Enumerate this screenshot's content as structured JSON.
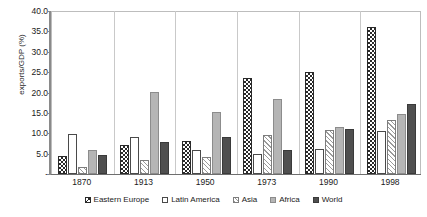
{
  "chart_data": {
    "type": "bar",
    "title": "",
    "xlabel": "",
    "ylabel": "exports/GDP (%)",
    "ylim": [
      0,
      40
    ],
    "ytick_step": 5,
    "ytick_labels": [
      "40.0",
      "35.0",
      "30.0",
      "25.0",
      "20.0",
      "15.0",
      "10.0",
      "5.0",
      "-"
    ],
    "ytick_values": [
      40,
      35,
      30,
      25,
      20,
      15,
      10,
      5,
      0
    ],
    "grid": false,
    "legend_position": "bottom",
    "categories": [
      "1870",
      "1913",
      "1950",
      "1973",
      "1990",
      "1998"
    ],
    "series": [
      {
        "name": "Eastern Europe",
        "fill": "dark-checkerboard",
        "color": "#2a2a2a",
        "values": [
          4.5,
          7.0,
          8.0,
          23.5,
          25.0,
          36.0
        ]
      },
      {
        "name": "Latin America",
        "fill": "white-outline",
        "color": "#ffffff",
        "values": [
          9.7,
          9.0,
          6.0,
          5.0,
          6.2,
          10.5
        ]
      },
      {
        "name": "Asia",
        "fill": "light-diagonal-hatch",
        "color": "#9a9a9a",
        "values": [
          1.7,
          3.4,
          4.2,
          9.6,
          10.8,
          13.2
        ]
      },
      {
        "name": "Africa",
        "fill": "solid-light-grey",
        "color": "#b5b5b5",
        "values": [
          5.8,
          20.2,
          15.1,
          18.4,
          11.5,
          14.8
        ]
      },
      {
        "name": "World",
        "fill": "solid-dark-grey",
        "color": "#4f4f4f",
        "values": [
          4.6,
          7.9,
          9.0,
          6.0,
          11.0,
          17.2
        ]
      }
    ]
  }
}
